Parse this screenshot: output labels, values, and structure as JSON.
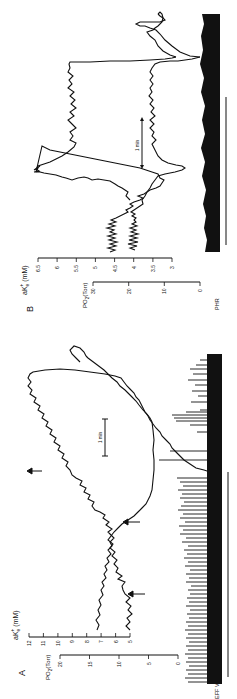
{
  "figure": {
    "orientation": "rotated 90deg counterclockwise",
    "panels": [
      {
        "id": "A",
        "label": "A",
        "ak_axis": {
          "label": "aK",
          "superscript": "+",
          "subscript": "e",
          "unit": "(mM)",
          "ticks": [
            "12",
            "11",
            "10",
            "9",
            "8",
            "7",
            "6",
            "5"
          ]
        },
        "po2_axis": {
          "label": "PO",
          "subscript": "2",
          "unit": "(Torr)",
          "ticks": [
            "20",
            "15",
            "10",
            "5",
            "0"
          ]
        },
        "neural_label": "EFF VAG",
        "scale_bar": "1 min"
      },
      {
        "id": "B",
        "label": "B",
        "ak_axis": {
          "label": "aK",
          "superscript": "+",
          "subscript": "e",
          "unit": "(mM)",
          "ticks": [
            "6.5",
            "6",
            "5.5",
            "5",
            "4.5",
            "4",
            "3.5",
            "3"
          ]
        },
        "po2_axis": {
          "label": "PO",
          "subscript": "2",
          "unit": "(Torr)",
          "ticks": [
            "30",
            "20",
            "10",
            "0"
          ]
        },
        "neural_label": "PHR",
        "scale_bar": "1 min"
      }
    ]
  },
  "colors": {
    "ink": "#111111",
    "background": "#ffffff"
  }
}
